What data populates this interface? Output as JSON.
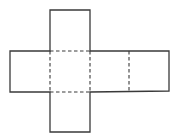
{
  "diagram": {
    "type": "cube-net",
    "colors": {
      "stroke": "#3a3a3a",
      "background": "#ffffff"
    },
    "solid_outline": [
      [
        50,
        10
      ],
      [
        90,
        10
      ],
      [
        90,
        51
      ],
      [
        169,
        51
      ],
      [
        169,
        91
      ],
      [
        90,
        92
      ],
      [
        90,
        132
      ],
      [
        50,
        132
      ],
      [
        50,
        92
      ],
      [
        10,
        92
      ],
      [
        10,
        51
      ],
      [
        50,
        51
      ]
    ],
    "dashed_folds": [
      {
        "name": "fold-top",
        "x1": 50,
        "y1": 51,
        "x2": 90,
        "y2": 51
      },
      {
        "name": "fold-bottom",
        "x1": 50,
        "y1": 92,
        "x2": 90,
        "y2": 92
      },
      {
        "name": "fold-left",
        "x1": 50,
        "y1": 51,
        "x2": 50,
        "y2": 92
      },
      {
        "name": "fold-center-right",
        "x1": 90,
        "y1": 51,
        "x2": 90,
        "y2": 92
      },
      {
        "name": "fold-right",
        "x1": 129,
        "y1": 51,
        "x2": 129,
        "y2": 91
      }
    ],
    "faces": [
      "top",
      "left",
      "center",
      "right",
      "far-right",
      "bottom"
    ]
  }
}
